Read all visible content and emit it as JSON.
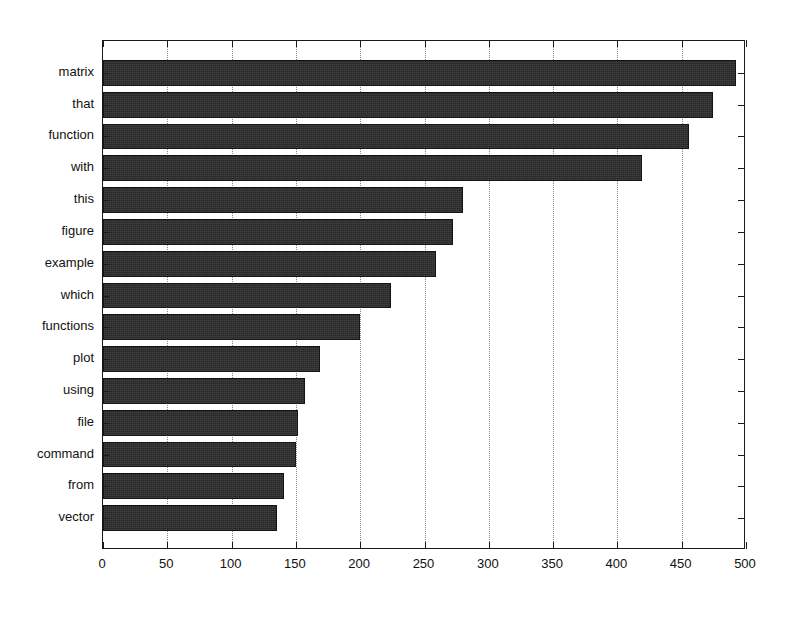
{
  "chart_data": {
    "type": "bar",
    "orientation": "horizontal",
    "title": "",
    "xlabel": "",
    "ylabel": "",
    "categories": [
      "matrix",
      "that",
      "function",
      "with",
      "this",
      "figure",
      "example",
      "which",
      "functions",
      "plot",
      "using",
      "file",
      "command",
      "from",
      "vector"
    ],
    "values": [
      492,
      474,
      456,
      419,
      280,
      272,
      259,
      224,
      200,
      169,
      157,
      152,
      150,
      141,
      135
    ],
    "xlim": [
      0,
      500
    ],
    "xticks": [
      0,
      50,
      100,
      150,
      200,
      250,
      300,
      350,
      400,
      450,
      500
    ],
    "xticklabels": [
      "0",
      "50",
      "100",
      "150",
      "200",
      "250",
      "300",
      "350",
      "400",
      "450",
      "500"
    ],
    "grid": "vertical-dotted",
    "legend": "none",
    "bar_color": "#262626",
    "axis_color": "#1a1a1a",
    "grid_color": "#8a8a8a",
    "background": "#ffffff"
  }
}
